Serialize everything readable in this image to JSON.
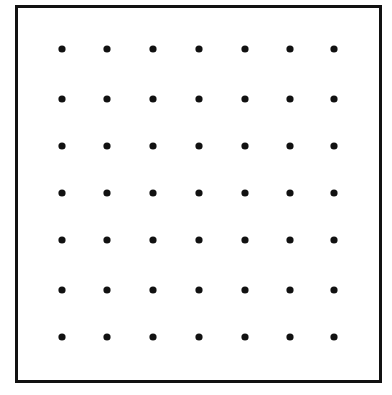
{
  "figure": {
    "title": "",
    "background_color": "#ffffff",
    "width": 392,
    "height": 395
  },
  "border": {
    "name": "rectangular-frame",
    "x": 16.5,
    "y": 6.5,
    "width": 364,
    "height": 375,
    "stroke_color": "#111111",
    "stroke_width": 3,
    "fill": "none"
  },
  "chart_data": {
    "type": "scatter",
    "title": "",
    "xlabel": "",
    "ylabel": "",
    "grid": false,
    "legend": null,
    "xlim": [
      0,
      8
    ],
    "ylim": [
      0,
      8
    ],
    "rows": 7,
    "columns": 7,
    "marker": {
      "shape": "circle",
      "color": "#111111",
      "radius": 3.6,
      "diameter": 7.2
    },
    "x_positions": [
      62,
      107,
      153,
      199,
      245,
      290,
      334
    ],
    "y_positions": [
      49,
      99,
      146,
      193,
      240,
      290,
      337
    ],
    "points": [
      {
        "x": 62,
        "y": 49
      },
      {
        "x": 107,
        "y": 49
      },
      {
        "x": 153,
        "y": 49
      },
      {
        "x": 199,
        "y": 49
      },
      {
        "x": 245,
        "y": 49
      },
      {
        "x": 290,
        "y": 49
      },
      {
        "x": 334,
        "y": 49
      },
      {
        "x": 62,
        "y": 99
      },
      {
        "x": 107,
        "y": 99
      },
      {
        "x": 153,
        "y": 99
      },
      {
        "x": 199,
        "y": 99
      },
      {
        "x": 245,
        "y": 99
      },
      {
        "x": 290,
        "y": 99
      },
      {
        "x": 334,
        "y": 99
      },
      {
        "x": 62,
        "y": 146
      },
      {
        "x": 107,
        "y": 146
      },
      {
        "x": 153,
        "y": 146
      },
      {
        "x": 199,
        "y": 146
      },
      {
        "x": 245,
        "y": 146
      },
      {
        "x": 290,
        "y": 146
      },
      {
        "x": 334,
        "y": 146
      },
      {
        "x": 62,
        "y": 193
      },
      {
        "x": 107,
        "y": 193
      },
      {
        "x": 153,
        "y": 193
      },
      {
        "x": 199,
        "y": 193
      },
      {
        "x": 245,
        "y": 193
      },
      {
        "x": 290,
        "y": 193
      },
      {
        "x": 334,
        "y": 193
      },
      {
        "x": 62,
        "y": 240
      },
      {
        "x": 107,
        "y": 240
      },
      {
        "x": 153,
        "y": 240
      },
      {
        "x": 199,
        "y": 240
      },
      {
        "x": 245,
        "y": 240
      },
      {
        "x": 290,
        "y": 240
      },
      {
        "x": 334,
        "y": 240
      },
      {
        "x": 62,
        "y": 290
      },
      {
        "x": 107,
        "y": 290
      },
      {
        "x": 153,
        "y": 290
      },
      {
        "x": 199,
        "y": 290
      },
      {
        "x": 245,
        "y": 290
      },
      {
        "x": 290,
        "y": 290
      },
      {
        "x": 334,
        "y": 290
      },
      {
        "x": 62,
        "y": 337
      },
      {
        "x": 107,
        "y": 337
      },
      {
        "x": 153,
        "y": 337
      },
      {
        "x": 199,
        "y": 337
      },
      {
        "x": 245,
        "y": 337
      },
      {
        "x": 290,
        "y": 337
      },
      {
        "x": 334,
        "y": 337
      }
    ]
  }
}
